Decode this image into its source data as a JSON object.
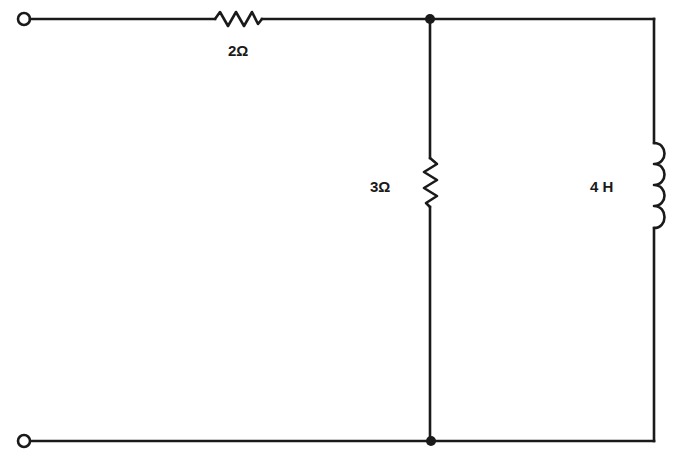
{
  "diagram": {
    "type": "circuit-schematic",
    "components": [
      {
        "id": "R1",
        "kind": "resistor",
        "label": "2Ω",
        "orientation": "horizontal",
        "position": "top-series"
      },
      {
        "id": "R2",
        "kind": "resistor",
        "label": "3Ω",
        "orientation": "vertical",
        "position": "middle-shunt"
      },
      {
        "id": "L1",
        "kind": "inductor",
        "label": "4 H",
        "orientation": "vertical",
        "position": "right-shunt"
      }
    ],
    "terminals": [
      {
        "id": "T1",
        "position": "top-left"
      },
      {
        "id": "T2",
        "position": "bottom-left"
      }
    ],
    "nodes": [
      {
        "id": "N1",
        "position": "top-junction"
      },
      {
        "id": "N2",
        "position": "bottom-junction"
      }
    ],
    "colors": {
      "line": "#1a1a1a",
      "background": "#ffffff"
    }
  }
}
